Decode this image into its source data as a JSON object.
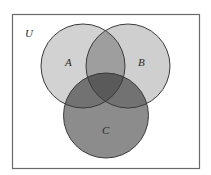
{
  "diagram": {
    "type": "venn",
    "universe_label": "U",
    "sets": [
      {
        "id": "A",
        "label": "A",
        "cx": 83,
        "cy": 66,
        "r": 42
      },
      {
        "id": "B",
        "label": "B",
        "cx": 128,
        "cy": 66,
        "r": 42
      },
      {
        "id": "C",
        "label": "C",
        "cx": 106,
        "cy": 115.5,
        "r": 42.5
      }
    ],
    "colors": {
      "background": "#ffffff",
      "universe_border": "#6a6a6a",
      "circle_stroke": "#3a3a3a",
      "A_only": "#d2d2d2",
      "B_only": "#cfcfcf",
      "C_only": "#8c8c8c",
      "A_and_B": "#9e9e9e",
      "A_and_C": "#707070",
      "B_and_C": "#707070",
      "A_and_B_and_C": "#5a5a5a"
    },
    "shaded_regions": [
      "A",
      "B",
      "C",
      "A∩B",
      "A∩C",
      "B∩C",
      "A∩B∩C"
    ]
  }
}
